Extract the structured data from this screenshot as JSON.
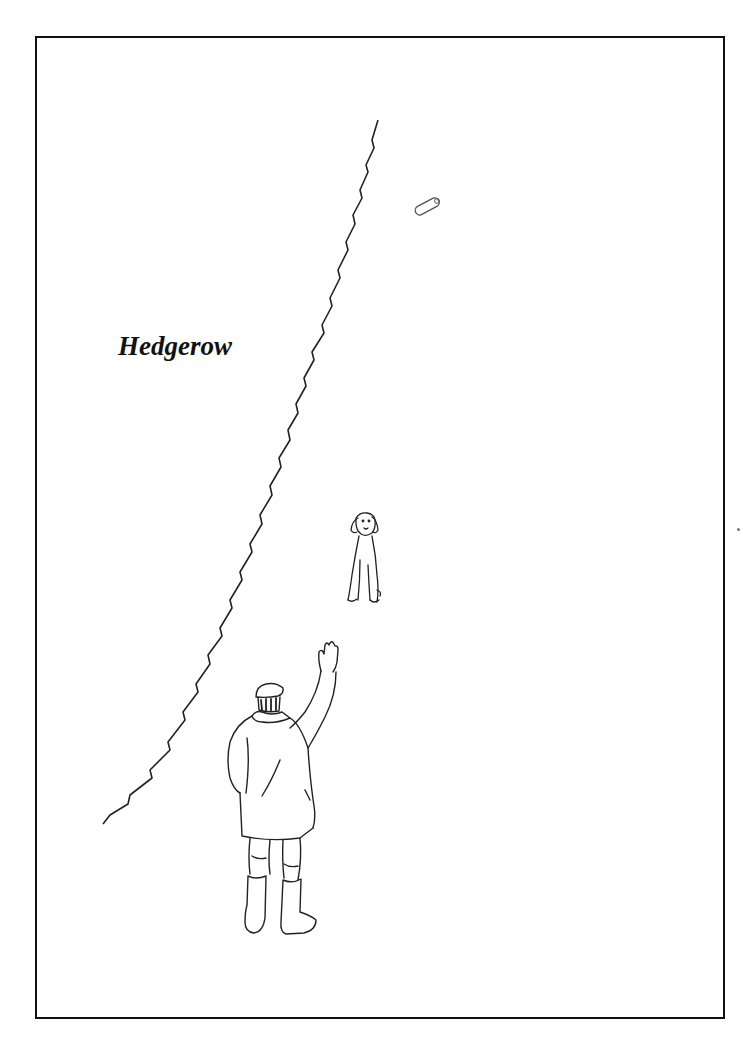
{
  "illustration": {
    "label": "Hedgerow",
    "elements": [
      "frame-border",
      "hedgerow-line",
      "thrown-dummy",
      "sitting-dog",
      "man-waving"
    ],
    "colors": {
      "ink": "#111111",
      "background": "#ffffff"
    }
  }
}
